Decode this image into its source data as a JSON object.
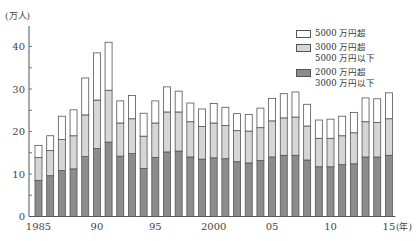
{
  "chart_data": {
    "type": "bar",
    "stacked": true,
    "title": "",
    "ylabel": "(万人)",
    "xlabel": "(年)",
    "ylim": [
      0,
      45
    ],
    "yticks": [
      0,
      10,
      20,
      30,
      40
    ],
    "xtick_labels": [
      {
        "year": 1985,
        "label": "1985"
      },
      {
        "year": 1990,
        "label": "90"
      },
      {
        "year": 1995,
        "label": "95"
      },
      {
        "year": 2000,
        "label": "2000"
      },
      {
        "year": 2005,
        "label": "05"
      },
      {
        "year": 2010,
        "label": "10"
      },
      {
        "year": 2015,
        "label": "15"
      }
    ],
    "categories": [
      1985,
      1986,
      1987,
      1988,
      1989,
      1990,
      1991,
      1992,
      1993,
      1994,
      1995,
      1996,
      1997,
      1998,
      1999,
      2000,
      2001,
      2002,
      2003,
      2004,
      2005,
      2006,
      2007,
      2008,
      2009,
      2010,
      2011,
      2012,
      2013,
      2014,
      2015
    ],
    "series": [
      {
        "name": "2000 万円超 3000 万円以下",
        "color": "#8c8c8c",
        "values": [
          8.5,
          9.6,
          10.8,
          11.2,
          14.1,
          16.0,
          17.5,
          14.2,
          14.8,
          11.3,
          13.9,
          15.2,
          15.4,
          14.0,
          13.5,
          13.8,
          13.6,
          12.9,
          12.6,
          13.2,
          14.0,
          14.4,
          14.4,
          13.3,
          11.7,
          11.7,
          12.2,
          12.4,
          14.0,
          14.0,
          14.4
        ]
      },
      {
        "name": "3000 万円超 5000 万円以下",
        "color": "#d6d6d6",
        "values": [
          5.4,
          5.9,
          7.3,
          7.8,
          9.8,
          11.4,
          12.2,
          7.8,
          8.2,
          7.6,
          8.1,
          9.4,
          9.2,
          8.3,
          7.7,
          8.2,
          7.8,
          7.3,
          7.5,
          7.7,
          8.5,
          8.8,
          9.0,
          8.0,
          6.7,
          6.7,
          6.8,
          7.3,
          8.3,
          8.1,
          8.6
        ]
      },
      {
        "name": "5000 万円超",
        "color": "#ffffff",
        "values": [
          2.8,
          3.5,
          5.5,
          6.1,
          8.7,
          11.1,
          11.3,
          5.2,
          5.5,
          5.4,
          5.2,
          5.9,
          4.9,
          4.4,
          4.1,
          4.6,
          4.3,
          4.0,
          3.9,
          4.6,
          5.3,
          5.7,
          5.9,
          5.1,
          4.3,
          4.5,
          4.6,
          4.8,
          5.6,
          5.6,
          6.1
        ]
      }
    ],
    "legend_position": "top-right",
    "grid": false
  },
  "legend": [
    {
      "line1": "5000 万円超",
      "line2": "",
      "color": "#ffffff"
    },
    {
      "line1": "3000 万円超",
      "line2": "5000 万円以下",
      "color": "#d6d6d6"
    },
    {
      "line1": "2000 万円超",
      "line2": "3000 万円以下",
      "color": "#8c8c8c"
    }
  ]
}
